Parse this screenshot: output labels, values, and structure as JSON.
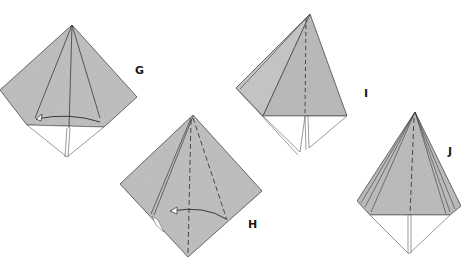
{
  "diagram": {
    "type": "origami-fold-sequence",
    "paper_color": "#bdbdbd",
    "paper_shadow": "#a9a9a9",
    "line_color": "#3a3a3a",
    "steps": [
      {
        "id": "G",
        "label": "G",
        "description": "kite with center fold lines and curved arrow at base"
      },
      {
        "id": "H",
        "label": "H",
        "description": "diamond with dashed valley folds and curved arrow"
      },
      {
        "id": "I",
        "label": "I",
        "description": "folded flap with dashed center line"
      },
      {
        "id": "J",
        "label": "J",
        "description": "pleated cone with dashed center line"
      }
    ]
  }
}
